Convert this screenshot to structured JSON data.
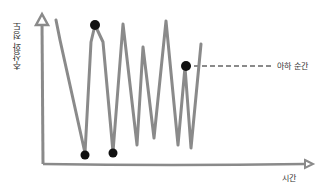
{
  "diagram": {
    "y_axis_label": "추상화 정도",
    "x_axis_label": "시간",
    "annotation": "아하 순간",
    "colors": {
      "line": "#8a8a8a",
      "point": "#111111",
      "text": "#333333"
    }
  }
}
